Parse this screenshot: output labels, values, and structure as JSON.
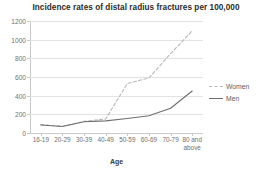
{
  "chart_data": {
    "type": "line",
    "title": "Incidence rates of distal radius fractures per 100,000",
    "xlabel": "Age",
    "ylabel": "",
    "categories": [
      "16-19",
      "20-29",
      "30-39",
      "40-49",
      "50-59",
      "60-69",
      "70-79",
      "80 and above"
    ],
    "series": [
      {
        "name": "Women",
        "style": "dashed",
        "color": "#b9b9b9",
        "values": [
          90,
          72,
          125,
          150,
          530,
          590,
          850,
          1095
        ]
      },
      {
        "name": "Men",
        "style": "solid",
        "color": "#6e6e6e",
        "values": [
          85,
          70,
          120,
          130,
          155,
          185,
          265,
          450
        ]
      }
    ],
    "ylim": [
      0,
      1200
    ],
    "yticks": [
      "0",
      "200",
      "400",
      "600",
      "800",
      "1000",
      "1200"
    ],
    "ytick_values": [
      0,
      200,
      400,
      600,
      800,
      1000,
      1200
    ],
    "grid": true,
    "legend_position": "right"
  },
  "legend": {
    "items": [
      {
        "label": "Women"
      },
      {
        "label": "Men"
      }
    ]
  }
}
